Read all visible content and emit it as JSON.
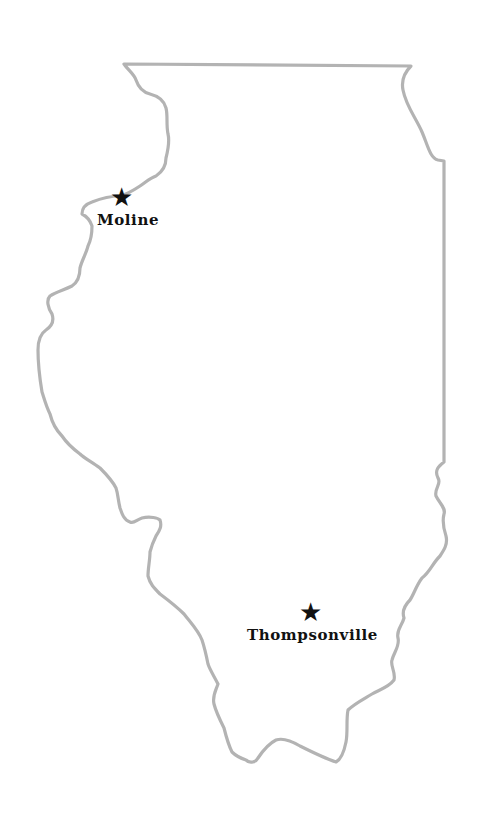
{
  "map": {
    "region": "Illinois",
    "outline_color": "#b3b3b3",
    "marker_color": "#111111",
    "background": "#ffffff"
  },
  "cities": [
    {
      "name": "Moline",
      "star": "★",
      "icon": "star-icon"
    },
    {
      "name": "Thompsonville",
      "star": "★",
      "icon": "star-icon"
    }
  ]
}
